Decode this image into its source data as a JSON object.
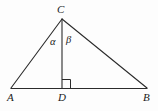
{
  "figure": {
    "background_color": "#fdfdfd",
    "stroke_color": "#2b2b2b",
    "text_color": "#1a1a1a"
  },
  "vertices": {
    "C": {
      "label": "C",
      "x": 62,
      "y": 19
    },
    "A": {
      "label": "A",
      "x": 11,
      "y": 88
    },
    "D": {
      "label": "D",
      "x": 62,
      "y": 88
    },
    "B": {
      "label": "B",
      "x": 147,
      "y": 88
    }
  },
  "angles": {
    "alpha": {
      "label": "α",
      "at": "C",
      "between": "CA and CD"
    },
    "beta": {
      "label": "β",
      "at": "C",
      "between": "CD and CB"
    }
  },
  "markers": {
    "right_angle": {
      "label": "right-angle-at-D",
      "at": "D",
      "opens": "toward B"
    }
  },
  "segments": [
    {
      "name": "side-CA",
      "from": "C",
      "to": "A"
    },
    {
      "name": "side-CB",
      "from": "C",
      "to": "B"
    },
    {
      "name": "base-AB",
      "from": "A",
      "to": "B"
    },
    {
      "name": "altitude-CD",
      "from": "C",
      "to": "D"
    }
  ]
}
